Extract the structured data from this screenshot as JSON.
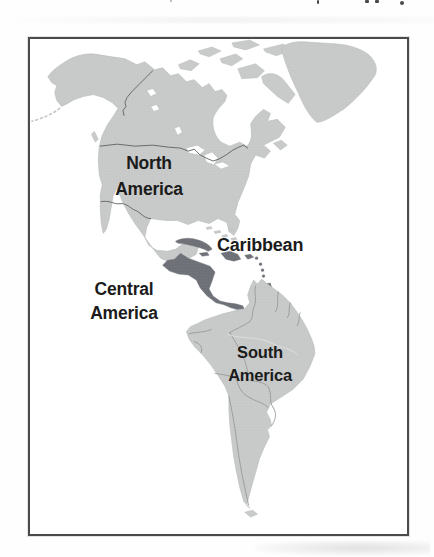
{
  "figure": {
    "type": "map",
    "labels": {
      "north_america": {
        "line1": "North",
        "line2": "America"
      },
      "caribbean": "Caribbean",
      "central_america": {
        "line1": "Central",
        "line2": "America"
      },
      "south_america": {
        "line1": "South",
        "line2": "America"
      }
    },
    "regions": [
      {
        "name": "North America",
        "style": "light"
      },
      {
        "name": "Greenland",
        "style": "light"
      },
      {
        "name": "Caribbean",
        "style": "highlighted"
      },
      {
        "name": "Central America",
        "style": "highlighted"
      },
      {
        "name": "South America",
        "style": "light"
      }
    ],
    "colors": {
      "land": "#c9cbca",
      "highlight": "#6e7077",
      "borders": "#8f9392",
      "national": "#5e5e5e",
      "coast": "#b7bbba",
      "frame": "#4b4b4b",
      "label": "#1b1b1b",
      "ocean": "#ffffff",
      "page-bg": "#fefefe"
    }
  }
}
